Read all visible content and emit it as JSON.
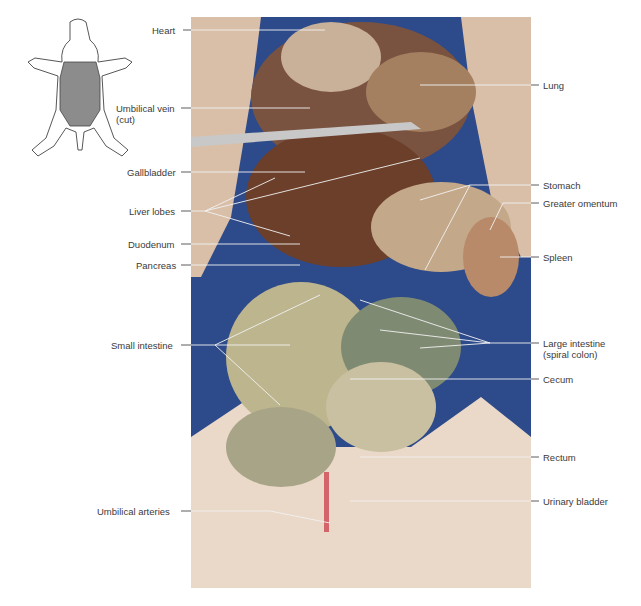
{
  "figure": {
    "type": "labeled dissection photograph",
    "orientation_icon": "pig-outline-with-shaded-torso"
  },
  "labels_left": [
    {
      "id": "heart",
      "text": "Heart",
      "x": 152,
      "y": 26
    },
    {
      "id": "umbilical-vein",
      "text": "Umbilical vein",
      "text2": "(cut)",
      "x": 116,
      "y": 104
    },
    {
      "id": "gallbladder",
      "text": "Gallbladder",
      "x": 127,
      "y": 168
    },
    {
      "id": "liver-lobes",
      "text": "Liver lobes",
      "x": 129,
      "y": 207
    },
    {
      "id": "duodenum",
      "text": "Duodenum",
      "x": 128,
      "y": 240
    },
    {
      "id": "pancreas",
      "text": "Pancreas",
      "x": 136,
      "y": 261
    },
    {
      "id": "small-intestine",
      "text": "Small intestine",
      "x": 111,
      "y": 341
    },
    {
      "id": "umbilical-arteries",
      "text": "Umbilical arteries",
      "x": 97,
      "y": 507
    }
  ],
  "labels_right": [
    {
      "id": "lung",
      "text": "Lung",
      "x": 543,
      "y": 81
    },
    {
      "id": "stomach",
      "text": "Stomach",
      "x": 543,
      "y": 181
    },
    {
      "id": "greater-omentum",
      "text": "Greater omentum",
      "x": 543,
      "y": 199
    },
    {
      "id": "spleen",
      "text": "Spleen",
      "x": 543,
      "y": 253
    },
    {
      "id": "large-intestine",
      "text": "Large intestine",
      "text2": "(spiral colon)",
      "x": 543,
      "y": 339
    },
    {
      "id": "cecum",
      "text": "Cecum",
      "x": 543,
      "y": 375
    },
    {
      "id": "rectum",
      "text": "Rectum",
      "x": 543,
      "y": 453
    },
    {
      "id": "urinary-bladder",
      "text": "Urinary bladder",
      "x": 543,
      "y": 497
    }
  ],
  "colors": {
    "background_cloth": "#2d4a8a",
    "skin": "#e8d3c0",
    "tissue": "#c9a98a",
    "liver": "#6b3f2a",
    "intestine": "#b7b08a",
    "leader_line_dark": "#333333",
    "leader_line_light": "#f2f2f2",
    "icon_shade": "#8c8c8c"
  }
}
